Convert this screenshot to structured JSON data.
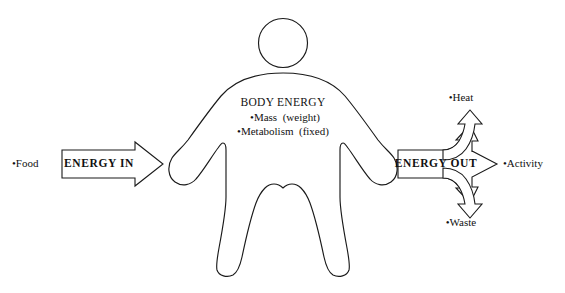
{
  "diagram": {
    "background_color": "#ffffff",
    "stroke_color": "#1a1a1a",
    "input": {
      "source_label": "•Food",
      "arrow_label": "ENERGY IN",
      "arrow_direction": "right"
    },
    "body": {
      "heading": "BODY ENERGY",
      "items": [
        "•Mass  (weight)",
        "•Metabolism  (fixed)"
      ],
      "figure_name": "human-body-silhouette"
    },
    "output": {
      "arrow_label": "ENERGY OUT",
      "arrow_direction": "trifurcating-right",
      "branches": [
        {
          "label": "•Heat",
          "direction": "up"
        },
        {
          "label": "•Activity",
          "direction": "right"
        },
        {
          "label": "•Waste",
          "direction": "down"
        }
      ]
    }
  }
}
